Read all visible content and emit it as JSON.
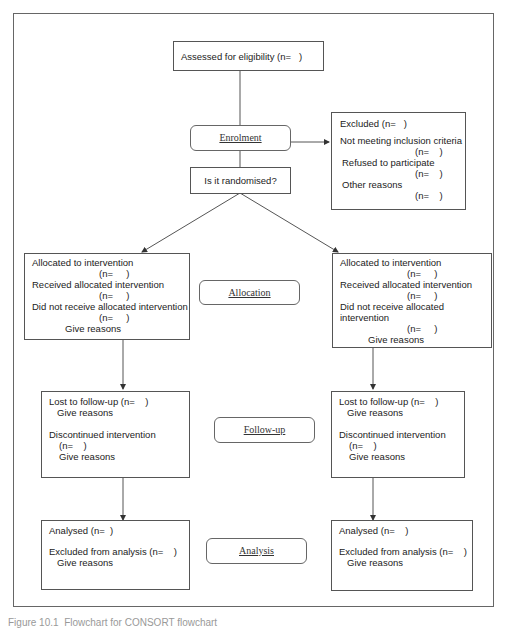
{
  "diagram": {
    "assessed": {
      "label": "Assessed for eligibility (n=   )"
    },
    "stages": {
      "enrolment": "Enrolment",
      "allocation": "Allocation",
      "followup": "Follow-up",
      "analysis": "Analysis"
    },
    "randomised": {
      "label": "Is it randomised?"
    },
    "excluded": {
      "lines": [
        "Excluded (n=   )",
        "Not meeting inclusion criteria",
        "(n=    )",
        "Refused to participate",
        "(n=    )",
        "Other reasons",
        "(n=    )"
      ]
    },
    "allocation_left": {
      "lines": [
        "Allocated to intervention",
        "(n=     )",
        "Received allocated intervention",
        "(n=     )",
        "Did not receive allocated intervention",
        "(n=     )",
        "Give reasons"
      ]
    },
    "allocation_right": {
      "lines": [
        "Allocated to intervention",
        "(n=     )",
        "Received allocated intervention",
        "(n=     )",
        "Did not receive allocated",
        "intervention",
        "(n=     )",
        "Give reasons"
      ]
    },
    "followup_left": {
      "lines": [
        "Lost to follow-up (n=    )",
        "Give reasons",
        "Discontinued intervention",
        "(n=    )",
        "Give reasons"
      ]
    },
    "followup_right": {
      "lines": [
        "Lost to follow-up (n=    )",
        "Give reasons",
        "Discontinued intervention",
        "(n=    )",
        "Give reasons"
      ]
    },
    "analysis_left": {
      "lines": [
        "Analysed (n=  )",
        "Excluded from analysis (n=    )",
        "Give reasons"
      ]
    },
    "analysis_right": {
      "lines": [
        "Analysed (n=    )",
        "Excluded from analysis (n=    )",
        "Give reasons"
      ]
    }
  },
  "caption": "Figure 10.1  Flowchart for CONSORT flowchart"
}
